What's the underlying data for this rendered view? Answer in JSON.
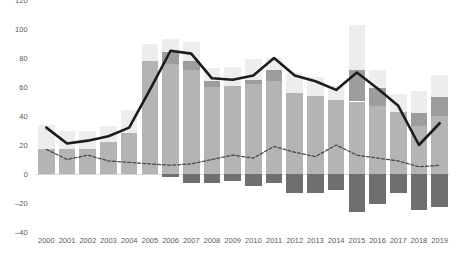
{
  "chart_data": {
    "type": "bar",
    "title": "",
    "subtitle": "",
    "xlabel": "",
    "ylabel": "",
    "ylim": [
      -40,
      120
    ],
    "xlim_years": [
      2000,
      2019
    ],
    "grid": false,
    "legend": "none",
    "y_ticks": [
      120,
      100,
      80,
      60,
      40,
      20,
      0,
      -20,
      -40
    ],
    "categories": [
      "2000",
      "2001",
      "2002",
      "2003",
      "2004",
      "2005",
      "2006",
      "2007",
      "2008",
      "2009",
      "2010",
      "2011",
      "2012",
      "2013",
      "2014",
      "2015",
      "2016",
      "2017",
      "2018",
      "2019"
    ],
    "series": [
      {
        "name": "stack-segment-light",
        "kind": "bar-stack",
        "color": "#ededed",
        "values": [
          17,
          13,
          13,
          11,
          16,
          12,
          9,
          13,
          9,
          13,
          14,
          8,
          14,
          13,
          10,
          31,
          13,
          12,
          15,
          15
        ]
      },
      {
        "name": "stack-segment-dark",
        "kind": "bar-stack",
        "color": "#9d9d9d",
        "values": [
          0,
          0,
          0,
          0,
          0,
          0,
          8,
          6,
          4,
          0,
          3,
          8,
          0,
          0,
          0,
          22,
          12,
          0,
          9,
          13
        ]
      },
      {
        "name": "stack-segment-mid",
        "kind": "bar-stack",
        "color": "#b4b4b4",
        "values": [
          17,
          17,
          17,
          22,
          28,
          78,
          76,
          72,
          60,
          61,
          62,
          64,
          56,
          54,
          51,
          50,
          47,
          43,
          33,
          40
        ]
      },
      {
        "name": "stack-segment-negative",
        "kind": "bar-stack",
        "color": "#6f6f6f",
        "values": [
          0,
          0,
          0,
          0,
          0,
          0,
          -2,
          -6,
          -6,
          -5,
          -8,
          -6,
          -13,
          -13,
          -11,
          -26,
          -21,
          -13,
          -25,
          -23
        ]
      },
      {
        "name": "solid-line",
        "kind": "line",
        "color": "#1c1c1c",
        "style": "solid",
        "values": [
          32,
          21,
          23,
          26,
          32,
          58,
          85,
          83,
          66,
          65,
          68,
          80,
          68,
          64,
          58,
          70,
          59,
          47,
          20,
          35
        ]
      },
      {
        "name": "dashed-line",
        "kind": "line",
        "color": "#4a4a4a",
        "style": "dashed",
        "values": [
          17,
          10,
          13,
          9,
          8,
          7,
          6,
          7,
          10,
          13,
          11,
          19,
          15,
          12,
          20,
          13,
          11,
          9,
          5,
          6
        ]
      }
    ]
  }
}
